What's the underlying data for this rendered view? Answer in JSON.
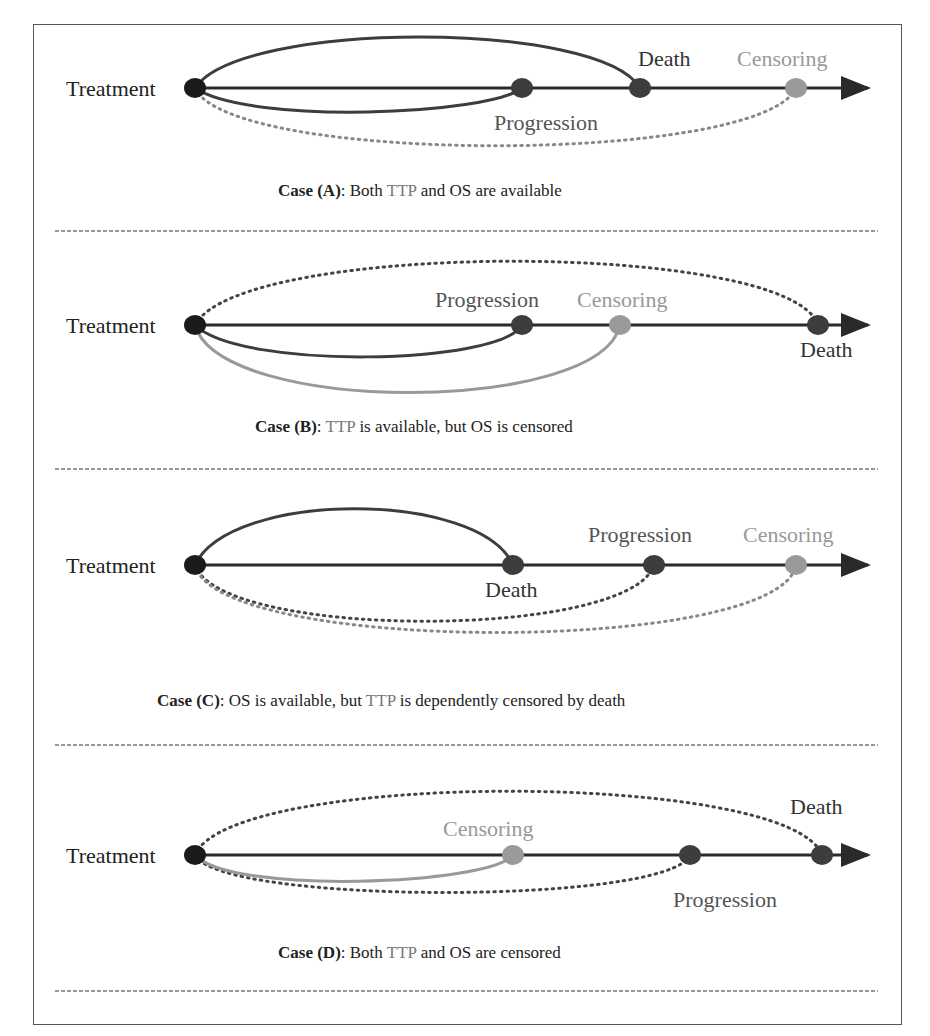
{
  "colors": {
    "axis": "#2a2a2a",
    "treatment": "#1a1a1a",
    "event": "#3d3d3d",
    "censor": "#9a9a9a",
    "label_dark": "#222222",
    "label_mid": "#555555",
    "label_light": "#999999"
  },
  "panels": [
    {
      "id": "A",
      "treatment": "Treatment",
      "progression": "Progression",
      "death": "Death",
      "censoring": "Censoring",
      "caption_bold": "Case (A)",
      "caption_rest": ": Both ",
      "caption_ttp": "TTP",
      "caption_and": " and OS are available"
    },
    {
      "id": "B",
      "treatment": "Treatment",
      "progression": "Progression",
      "death": "Death",
      "censoring": "Censoring",
      "caption_bold": "Case (B)",
      "caption_rest": ": ",
      "caption_ttp": "TTP",
      "caption_and": " is available, but OS is censored"
    },
    {
      "id": "C",
      "treatment": "Treatment",
      "progression": "Progression",
      "death": "Death",
      "censoring": "Censoring",
      "caption_bold": "Case (C)",
      "caption_rest": ": OS is available, but ",
      "caption_ttp": "TTP",
      "caption_and": " is dependently censored by death"
    },
    {
      "id": "D",
      "treatment": "Treatment",
      "progression": "Progression",
      "death": "Death",
      "censoring": "Censoring",
      "caption_bold": "Case (D)",
      "caption_rest": ": Both ",
      "caption_ttp": "TTP",
      "caption_and": " and OS are censored"
    }
  ]
}
